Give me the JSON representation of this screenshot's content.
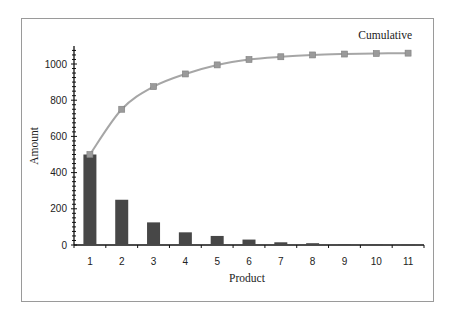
{
  "chart_data": {
    "type": "bar+line",
    "title": "",
    "xlabel": "Product",
    "ylabel": "Amount",
    "categories": [
      "1",
      "2",
      "3",
      "4",
      "5",
      "6",
      "7",
      "8",
      "9",
      "10",
      "11"
    ],
    "series": [
      {
        "name": "Amount",
        "type": "bar",
        "color": "#474747",
        "values": [
          500,
          250,
          125,
          70,
          50,
          30,
          15,
          10,
          5,
          3,
          2
        ]
      },
      {
        "name": "Cumulative",
        "type": "line",
        "color": "#a6a6a6",
        "marker": "square",
        "values": [
          500,
          750,
          875,
          945,
          995,
          1025,
          1040,
          1050,
          1055,
          1058,
          1060
        ]
      }
    ],
    "annotations": [
      {
        "text": "Cumulative",
        "position": "top-right"
      }
    ],
    "ylim": [
      0,
      1100
    ],
    "yticks": [
      0,
      200,
      400,
      600,
      800,
      1000
    ],
    "grid": false,
    "legend": "none"
  },
  "labels": {
    "xlabel": "Product",
    "ylabel": "Amount",
    "series_annotation": "Cumulative"
  }
}
